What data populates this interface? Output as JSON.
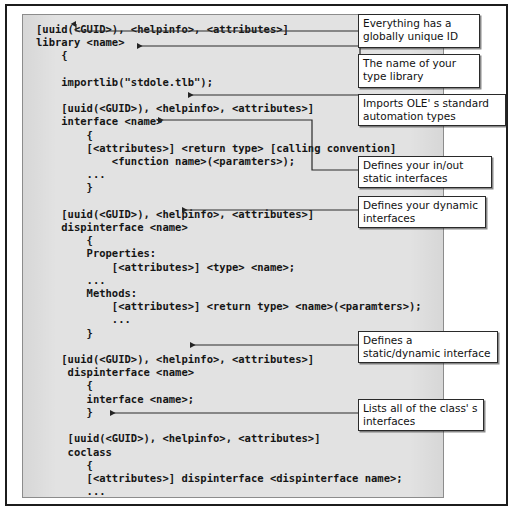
{
  "figure": {
    "kind": "annotated-code-listing",
    "colors": {
      "page_background": "#ffffff",
      "panel_background": "#e2e2e2",
      "panel_border": "#8c8c8c",
      "frame_border": "#1c1c1c",
      "code_text": "#151515",
      "callout_background": "#ffffff",
      "callout_border": "#2a2a2a",
      "connector": "#2a2a2a"
    }
  },
  "code": {
    "language": "IDL",
    "text": "[uuid(<GUID>), <helpinfo>, <attributes>]\nlibrary <name>\n    {\n\n    importlib(\"stdole.tlb\");\n\n    [uuid(<GUID>), <helpinfo>, <attributes>]\n    interface <name>\n        {\n        [<attributes>] <return type> [calling convention]\n            <function name>(<paramters>);\n        ...\n        }\n\n    [uuid(<GUID>), <helpinfo>, <attributes>]\n    dispinterface <name>\n        {\n        Properties:\n            [<attributes>] <type> <name>;\n        ...\n        Methods:\n            [<attributes>] <return type> <name>(<paramters>);\n            ...\n        }\n\n    [uuid(<GUID>), <helpinfo>, <attributes>]\n     dispinterface <name>\n        {\n        interface <name>;\n        }\n\n     [uuid(<GUID>), <helpinfo>, <attributes>]\n     coclass\n        {\n        [<attributes>] dispinterface <dispinterface name>;\n        ...\n        [<attributes>] interface <interface name>;\n        }\n    };",
    "lines": [
      "[uuid(<GUID>), <helpinfo>, <attributes>]",
      "library <name>",
      "    {",
      "",
      "    importlib(\"stdole.tlb\");",
      "",
      "    [uuid(<GUID>), <helpinfo>, <attributes>]",
      "    interface <name>",
      "        {",
      "        [<attributes>] <return type> [calling convention]",
      "            <function name>(<paramters>);",
      "        ...",
      "        }",
      "",
      "    [uuid(<GUID>), <helpinfo>, <attributes>]",
      "    dispinterface <name>",
      "        {",
      "        Properties:",
      "            [<attributes>] <type> <name>;",
      "        ...",
      "        Methods:",
      "            [<attributes>] <return type> <name>(<paramters>);",
      "            ...",
      "        }",
      "",
      "    [uuid(<GUID>), <helpinfo>, <attributes>]",
      "     dispinterface <name>",
      "        {",
      "        interface <name>;",
      "        }",
      "",
      "     [uuid(<GUID>), <helpinfo>, <attributes>]",
      "     coclass",
      "        {",
      "        [<attributes>] dispinterface <dispinterface name>;",
      "        ...",
      "        [<attributes>] interface <interface name>;",
      "        }",
      "    };"
    ]
  },
  "callouts": [
    {
      "id": "guid-callout",
      "text": "Everything has a globally unique ID",
      "target": "uuid(<GUID>)",
      "arrow": "down"
    },
    {
      "id": "library-name-callout",
      "text": "The name of your type library",
      "target": "library <name>",
      "arrow": "left"
    },
    {
      "id": "importlib-callout",
      "text": "Imports OLE' s standard automation types",
      "target": "importlib(\"stdole.tlb\");",
      "arrow": "left"
    },
    {
      "id": "interface-callout",
      "text": "Defines your in/out static interfaces",
      "target": "interface <name>",
      "arrow": "left"
    },
    {
      "id": "dispinterface-callout",
      "text": "Defines your dynamic interfaces",
      "target": "dispinterface <name>",
      "arrow": "left"
    },
    {
      "id": "static-dynamic-callout",
      "text": "Defines a static/dynamic interface",
      "target": "dispinterface <name>",
      "arrow": "left"
    },
    {
      "id": "coclass-callout",
      "text": "Lists all of the class' s interfaces",
      "target": "coclass",
      "arrow": "left"
    }
  ]
}
